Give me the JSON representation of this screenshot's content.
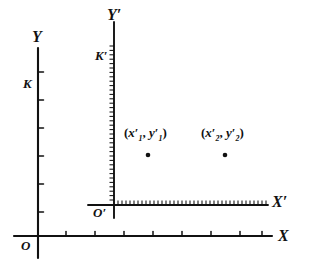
{
  "figure": {
    "ink_color": "#111111",
    "background_color": "#ffffff",
    "axes": [
      {
        "id": "x-axis",
        "label": "X",
        "orientation": "horizontal",
        "tick_count": 8,
        "tick_style": "coarse"
      },
      {
        "id": "y-axis",
        "label": "Y",
        "orientation": "vertical",
        "tick_count": 6,
        "tick_style": "coarse"
      },
      {
        "id": "x-prime-axis",
        "label": "X′",
        "orientation": "horizontal",
        "tick_count": 38,
        "tick_style": "fine"
      },
      {
        "id": "y-prime-axis",
        "label": "Y′",
        "orientation": "vertical",
        "tick_count": 36,
        "tick_style": "fine"
      }
    ],
    "origins": [
      {
        "id": "origin-unprimed",
        "label": "O"
      },
      {
        "id": "origin-primed",
        "label": "O′"
      }
    ],
    "scale_marks": [
      {
        "id": "scale-k",
        "label": "K",
        "axis": "y-axis"
      },
      {
        "id": "scale-k-prime",
        "label": "K′",
        "axis": "y-prime-axis"
      }
    ],
    "points": [
      {
        "id": "point-1",
        "label": "(x′1, y′1)",
        "label_parts": {
          "open": "(",
          "x": "x",
          "x_prime": "′",
          "x_sub": "1",
          "comma": ", ",
          "y": "y",
          "y_prime": "′",
          "y_sub": "1",
          "close": ")"
        }
      },
      {
        "id": "point-2",
        "label": "(x′2, y′2)",
        "label_parts": {
          "open": "(",
          "x": "x",
          "x_prime": "′",
          "x_sub": "2",
          "comma": ", ",
          "y": "y",
          "y_prime": "′",
          "y_sub": "2",
          "close": ")"
        }
      }
    ]
  }
}
